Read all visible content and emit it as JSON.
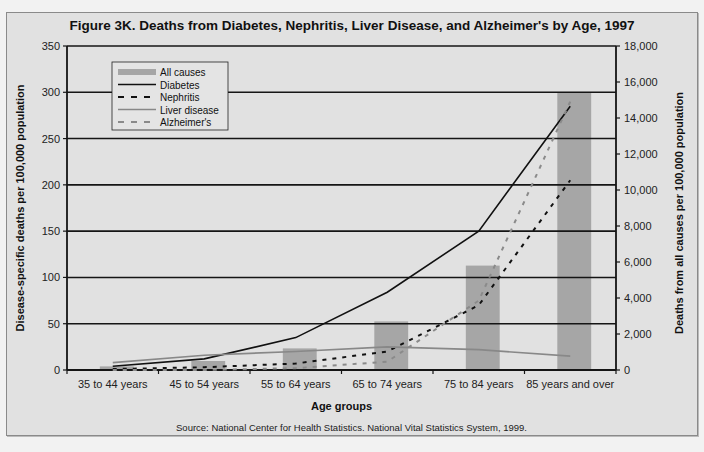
{
  "chart_data": {
    "type": "bar",
    "title": "Figure 3K. Deaths from Diabetes, Nephritis, Liver Disease, and Alzheimer's by Age, 1997",
    "xlabel": "Age groups",
    "ylabel": "Disease-specific deaths per 100,000 population",
    "y2label": "Deaths from all causes per 100,000 population",
    "categories": [
      "35 to 44 years",
      "45 to 54 years",
      "55 to 64 years",
      "65 to 74 years",
      "75 to 84 years",
      "85 years and over"
    ],
    "ylim": [
      0,
      350
    ],
    "y2lim": [
      0,
      18000
    ],
    "yticks": [
      "0",
      "50",
      "100",
      "150",
      "200",
      "250",
      "300",
      "350"
    ],
    "y2ticks": [
      "0",
      "2,000",
      "4,000",
      "6,000",
      "8,000",
      "10,000",
      "12,000",
      "14,000",
      "16,000",
      "18,000"
    ],
    "grid": true,
    "legend_position": "upper-left",
    "series": [
      {
        "name": "All causes",
        "type": "bar",
        "axis": "right",
        "color": "#a6a6a6",
        "values": [
          200,
          500,
          1200,
          2700,
          5800,
          15400
        ]
      },
      {
        "name": "Diabetes",
        "type": "line",
        "axis": "left",
        "style": "solid",
        "color": "#111111",
        "values": [
          4,
          12,
          35,
          84,
          150,
          285
        ]
      },
      {
        "name": "Nephritis",
        "type": "line",
        "axis": "left",
        "style": "dashed",
        "color": "#111111",
        "values": [
          1,
          3,
          7,
          20,
          70,
          205
        ]
      },
      {
        "name": "Liver disease",
        "type": "line",
        "axis": "left",
        "style": "solid",
        "color": "#888888",
        "values": [
          8,
          16,
          20,
          25,
          22,
          15
        ]
      },
      {
        "name": "Alzheimer's",
        "type": "line",
        "axis": "left",
        "style": "dashed",
        "color": "#8a8a8a",
        "values": [
          0,
          0,
          2,
          9,
          75,
          290
        ]
      }
    ],
    "source": "Source: National Center for Health Statistics.  National Vital Statistics System, 1999."
  }
}
